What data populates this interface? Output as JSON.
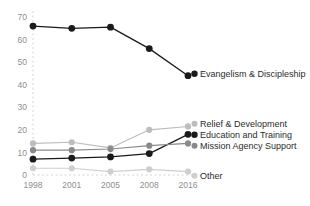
{
  "chart_data": {
    "type": "line",
    "title": "",
    "subtitle": "",
    "xlabel": "",
    "ylabel": "",
    "categories": [
      "1998",
      "2001",
      "2005",
      "2008",
      "2016"
    ],
    "x_tick_labels": [
      "1998",
      "2001",
      "2005",
      "2008",
      "2016"
    ],
    "y_tick_labels": [
      "0",
      "10",
      "20",
      "30",
      "40",
      "50",
      "60",
      "70"
    ],
    "y_ticks": [
      0,
      10,
      20,
      30,
      40,
      50,
      60,
      70
    ],
    "ylim": [
      0,
      70
    ],
    "xlim_categories": 5,
    "grid": "vertical-dashed-at-first-category",
    "legend_position": "inline-right",
    "series": [
      {
        "name": "Evangelism & Discipleship",
        "label": "Evangelism & Discipleship",
        "color": "#1a1a1a",
        "marker": "circle",
        "values": [
          66,
          65,
          65.5,
          56,
          44
        ]
      },
      {
        "name": "Relief & Development",
        "label": "Relief & Development",
        "color": "#bdbdbd",
        "marker": "circle",
        "values": [
          14,
          14.5,
          12,
          20,
          21.5
        ]
      },
      {
        "name": "Education and Training",
        "label": "Education and Training",
        "color": "#1a1a1a",
        "marker": "circle",
        "values": [
          7,
          7.5,
          8,
          9.5,
          18
        ]
      },
      {
        "name": "Mission Agency Support",
        "label": "Mission Agency Support",
        "color": "#8a8a8a",
        "marker": "circle",
        "values": [
          11,
          11,
          11.5,
          13,
          14
        ]
      },
      {
        "name": "Other",
        "label": "Other",
        "color": "#cfcfcf",
        "marker": "circle",
        "values": [
          3,
          3,
          1.5,
          2.5,
          1.5
        ]
      }
    ],
    "colors": {
      "evangelism": "#1a1a1a",
      "relief": "#bdbdbd",
      "education": "#1a1a1a",
      "mission_agency": "#8a8a8a",
      "other": "#cfcfcf",
      "axis_text": "#8e8e8e",
      "gridline": "#d4d4d4",
      "label_text": "#2c2c2c",
      "background": "#ffffff"
    }
  }
}
